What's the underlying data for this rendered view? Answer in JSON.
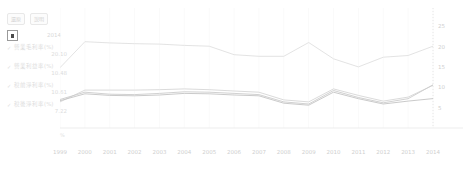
{
  "toolbar": {
    "buttons": [
      {
        "label": "還原",
        "name": "reset-button"
      },
      {
        "label": "說明",
        "name": "help-button"
      }
    ]
  },
  "selector": {
    "checkbox_icon": "filled-square-icon",
    "value": "2014"
  },
  "legend": {
    "check_glyph": "✓",
    "items": [
      {
        "label": "營業毛利率(%)",
        "value": "20.10",
        "color": "#dcdcdc"
      },
      {
        "label": "營業利益率(%)",
        "value": "10.48",
        "color": "#d4d4d4"
      },
      {
        "label": "稅前淨利率(%)",
        "value": "10.61",
        "color": "#c8c8c8"
      },
      {
        "label": "稅後淨利率(%)",
        "value": "7.22",
        "color": "#bfbfbf"
      }
    ]
  },
  "axis_unit": "%",
  "chart_data": {
    "type": "line",
    "title": "",
    "subtitle": "",
    "xlabel": "",
    "ylabel": "%",
    "grid": true,
    "legend_position": "left",
    "ylim": [
      0,
      28
    ],
    "yticks": [
      5,
      10,
      15,
      20,
      25
    ],
    "categories": [
      "1999",
      "2000",
      "2001",
      "2002",
      "2003",
      "2004",
      "2005",
      "2006",
      "2007",
      "2008",
      "2009",
      "2010",
      "2011",
      "2012",
      "2013",
      "2014"
    ],
    "series": [
      {
        "name": "營業毛利率(%)",
        "color": "#e0e0e0",
        "values": [
          14.8,
          21.2,
          20.9,
          20.7,
          20.6,
          20.3,
          20.1,
          18.0,
          17.6,
          17.6,
          21.0,
          17.0,
          15.0,
          17.4,
          17.8,
          20.1
        ]
      },
      {
        "name": "營業利益率(%)",
        "color": "#d6d6d6",
        "values": [
          6.4,
          9.3,
          9.3,
          9.3,
          9.4,
          9.6,
          9.4,
          9.1,
          8.8,
          6.9,
          6.4,
          9.6,
          8.0,
          6.6,
          7.6,
          10.48
        ]
      },
      {
        "name": "稅前淨利率(%)",
        "color": "#cccccc",
        "values": [
          7.0,
          8.8,
          8.3,
          8.2,
          8.5,
          8.9,
          8.8,
          8.5,
          8.2,
          6.4,
          5.9,
          9.2,
          7.5,
          6.2,
          7.2,
          10.61
        ]
      },
      {
        "name": "稅後淨利率(%)",
        "color": "#c4c4c4",
        "values": [
          6.7,
          8.4,
          8.0,
          7.9,
          8.1,
          8.5,
          8.4,
          8.1,
          7.9,
          6.1,
          5.6,
          8.8,
          7.2,
          5.9,
          6.6,
          7.22
        ]
      }
    ]
  }
}
